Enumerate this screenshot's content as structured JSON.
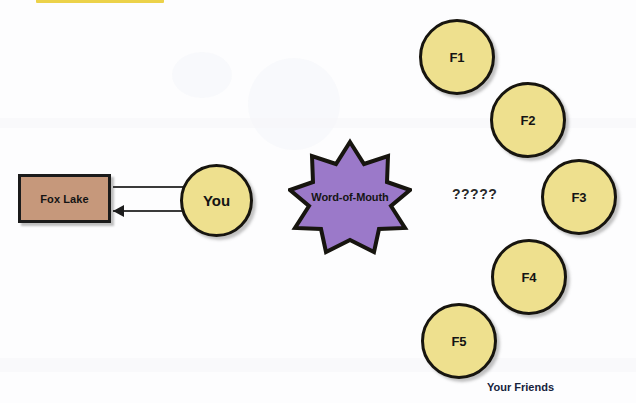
{
  "diagram": {
    "title_highlight": {
      "name": "highlight-bar",
      "color": "#ecd24a"
    },
    "source_node": {
      "label": "Fox Lake",
      "fill": "#c6987b",
      "stroke": "#1b1b1b"
    },
    "you_node": {
      "label": "You",
      "fill": "#eee08e",
      "stroke": "#17150f"
    },
    "connector": {
      "outbound_arrow": "arrow-right",
      "inbound_arrow": "arrow-left"
    },
    "mechanism_node": {
      "label": "Word-of-Mouth",
      "shape": "10-point-star",
      "fill": "#9b79c9",
      "stroke": "#17150f"
    },
    "unknown_marker": {
      "label": "?????"
    },
    "friends": {
      "caption_word1": "Your",
      "caption_word2": "Friends",
      "caption": "Your Friends",
      "fill": "#eee08e",
      "stroke": "#17150f",
      "nodes": [
        {
          "label": "F1"
        },
        {
          "label": "F2"
        },
        {
          "label": "F3"
        },
        {
          "label": "F4"
        },
        {
          "label": "F5"
        }
      ]
    }
  }
}
